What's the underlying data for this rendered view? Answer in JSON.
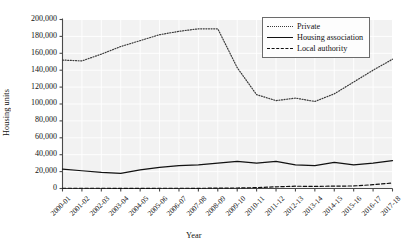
{
  "chart_data": {
    "type": "line",
    "title": "",
    "xlabel": "Year",
    "ylabel": "Housing units",
    "categories": [
      "2000-01",
      "2001-02",
      "2002-03",
      "2003-04",
      "2004-05",
      "2005-06",
      "2006-07",
      "2007-08",
      "2008-09",
      "2009-10",
      "2010-11",
      "2011-12",
      "2012-13",
      "2013-14",
      "2014-15",
      "2015-16",
      "2016-17",
      "2017-18"
    ],
    "ylim": [
      0,
      200000
    ],
    "ytick_values": [
      0,
      20000,
      40000,
      60000,
      80000,
      100000,
      120000,
      140000,
      160000,
      180000,
      200000
    ],
    "ytick_labels": [
      "0",
      "20,000",
      "40,000",
      "60,000",
      "80,000",
      "100,000",
      "120,000",
      "140,000",
      "160,000",
      "180,000",
      "200,000"
    ],
    "grid": true,
    "legend_position": "top-right",
    "series": [
      {
        "name": "Private",
        "style": "dotted",
        "color": "#3a3a3a",
        "values": [
          152000,
          151000,
          159000,
          168000,
          175000,
          182000,
          186000,
          189000,
          189000,
          143000,
          111000,
          104000,
          107000,
          103000,
          112000,
          126000,
          140000,
          153000
        ]
      },
      {
        "name": "Housing association",
        "style": "solid",
        "color": "#111111",
        "values": [
          23000,
          21000,
          19000,
          18000,
          22000,
          25000,
          27000,
          28000,
          30000,
          32000,
          30000,
          32000,
          28000,
          27000,
          31000,
          28000,
          30000,
          33000
        ]
      },
      {
        "name": "Local authority",
        "style": "dashed",
        "color": "#111111",
        "values": [
          300,
          300,
          300,
          200,
          200,
          300,
          300,
          250,
          400,
          600,
          1000,
          2000,
          2700,
          2500,
          2800,
          3000,
          4500,
          6500
        ]
      }
    ]
  },
  "legend": {
    "items": [
      {
        "label": "Private"
      },
      {
        "label": "Housing association"
      },
      {
        "label": "Local authority"
      }
    ]
  }
}
